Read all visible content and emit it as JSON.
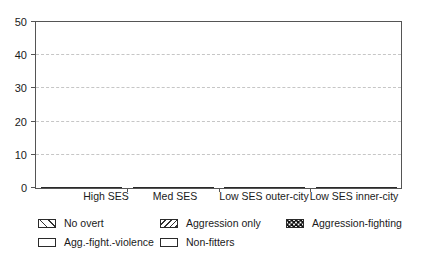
{
  "chart_data": {
    "type": "bar",
    "title": "",
    "xlabel": "",
    "ylabel": "",
    "ylim": [
      0,
      50
    ],
    "y_ticks": [
      0,
      10,
      20,
      30,
      40,
      50
    ],
    "gridlines": [
      10,
      20,
      30,
      40
    ],
    "grid_style": "dashed",
    "legend_position": "bottom",
    "categories": [
      "High SES",
      "Med SES",
      "Low SES outer-city",
      "Low SES inner-city"
    ],
    "series": [
      {
        "name": "No overt",
        "pattern": "backslash-hatch",
        "values": [
          47,
          30,
          28,
          19
        ]
      },
      {
        "name": "Aggression only",
        "pattern": "slash-hatch",
        "values": [
          20,
          20,
          16,
          6
        ]
      },
      {
        "name": "Aggression-fighting",
        "pattern": "dots",
        "values": [
          20,
          34,
          37,
          40
        ]
      },
      {
        "name": "Agg.-fight.-violence",
        "pattern": "solid-black",
        "values": [
          8,
          12,
          15,
          27
        ]
      },
      {
        "name": "Non-fitters",
        "pattern": "open-white",
        "values": [
          6,
          8,
          8,
          14
        ]
      }
    ],
    "colors": {
      "ink": "#1a1a1a",
      "frame": "#555555",
      "grid": "#c6c6c6",
      "background": "#ffffff"
    }
  }
}
